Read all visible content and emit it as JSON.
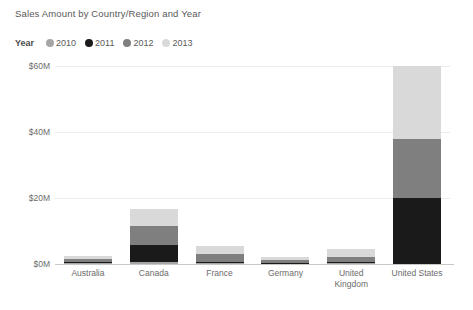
{
  "chart": {
    "title": "Sales Amount by Country/Region and Year",
    "legend": {
      "title": "Year",
      "items": [
        {
          "label": "2010",
          "color": "#a6a6a6"
        },
        {
          "label": "2011",
          "color": "#1a1a1a"
        },
        {
          "label": "2012",
          "color": "#7f7f7f"
        },
        {
          "label": "2013",
          "color": "#d9d9d9"
        }
      ]
    }
  },
  "chart_data": {
    "type": "bar",
    "subtype": "stacked-column",
    "title": "Sales Amount by Country/Region and Year",
    "xlabel": "",
    "ylabel": "",
    "categories": [
      "Australia",
      "Canada",
      "France",
      "Germany",
      "United\nKingdom",
      "United States"
    ],
    "series": [
      {
        "name": "2010",
        "color": "#a6a6a6",
        "values": [
          0.3,
          0.6,
          0.2,
          0.1,
          0.2,
          0.0
        ]
      },
      {
        "name": "2011",
        "color": "#1a1a1a",
        "values": [
          0.2,
          5.2,
          0.3,
          0.1,
          0.3,
          20.0
        ]
      },
      {
        "name": "2012",
        "color": "#7f7f7f",
        "values": [
          1.0,
          5.6,
          2.4,
          0.9,
          1.6,
          18.0
        ]
      },
      {
        "name": "2013",
        "color": "#d9d9d9",
        "values": [
          1.0,
          5.3,
          2.6,
          0.9,
          2.4,
          22.0
        ]
      }
    ],
    "totals": [
      2.5,
      16.7,
      5.5,
      2.0,
      4.5,
      60.0
    ],
    "ylim": [
      0,
      60
    ],
    "yticks": [
      0,
      20,
      40,
      60
    ],
    "ytick_labels": [
      "$0M",
      "$20M",
      "$40M",
      "$60M"
    ],
    "grid": true,
    "legend_position": "top-left"
  }
}
